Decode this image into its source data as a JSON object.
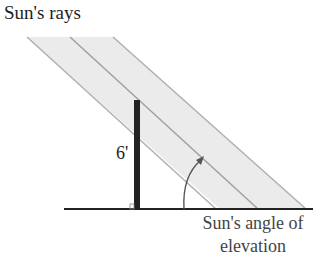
{
  "diagram": {
    "title": "Sun's rays",
    "pole_height_label": "6'",
    "angle_label_line1": "Sun's angle of",
    "angle_label_line2": "elevation",
    "colors": {
      "ray_band_fill": "#e8e8e8",
      "ray_line": "#a9a9a9",
      "pole": "#222222",
      "ground": "#222222",
      "arrow": "#555555"
    }
  }
}
